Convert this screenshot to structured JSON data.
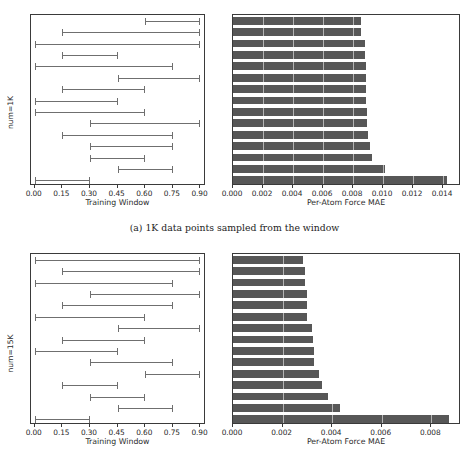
{
  "figure": {
    "captions": [
      {
        "text": "(a) 1K data points sampled from the window"
      },
      {
        "text": "(b) 15K data points sampled from the window"
      }
    ]
  },
  "chart_data": [
    {
      "type": "bar",
      "subplot": "a-left",
      "orientation": "horizontal-interval",
      "title": "",
      "xlabel": "Training Window",
      "ylabel": "num=1K",
      "xlim": [
        -0.02,
        0.93
      ],
      "xticks": [
        0.0,
        0.15,
        0.3,
        0.45,
        0.6,
        0.75,
        0.9
      ],
      "xticklabels": [
        "0.00",
        "0.15",
        "0.30",
        "0.45",
        "0.60",
        "0.75",
        "0.90"
      ],
      "grid": false,
      "n_items": 15,
      "intervals": [
        {
          "start": 0.6,
          "end": 0.9
        },
        {
          "start": 0.15,
          "end": 0.9
        },
        {
          "start": 0.0,
          "end": 0.9
        },
        {
          "start": 0.15,
          "end": 0.45
        },
        {
          "start": 0.0,
          "end": 0.75
        },
        {
          "start": 0.45,
          "end": 0.9
        },
        {
          "start": 0.15,
          "end": 0.6
        },
        {
          "start": 0.0,
          "end": 0.45
        },
        {
          "start": 0.0,
          "end": 0.6
        },
        {
          "start": 0.3,
          "end": 0.9
        },
        {
          "start": 0.15,
          "end": 0.75
        },
        {
          "start": 0.3,
          "end": 0.75
        },
        {
          "start": 0.3,
          "end": 0.6
        },
        {
          "start": 0.45,
          "end": 0.75
        },
        {
          "start": 0.0,
          "end": 0.3
        }
      ]
    },
    {
      "type": "bar",
      "subplot": "a-right",
      "orientation": "horizontal",
      "title": "",
      "xlabel": "Per-Atom Force MAE",
      "ylabel": "",
      "xlim": [
        0.0,
        0.0152
      ],
      "xticks": [
        0.0,
        0.002,
        0.004,
        0.006,
        0.008,
        0.01,
        0.012,
        0.014
      ],
      "xticklabels": [
        "0.000",
        "0.002",
        "0.004",
        "0.006",
        "0.008",
        "0.010",
        "0.012",
        "0.014"
      ],
      "grid": false,
      "values": [
        0.0085,
        0.00856,
        0.0088,
        0.00878,
        0.00886,
        0.00888,
        0.00888,
        0.00888,
        0.0089,
        0.00894,
        0.00896,
        0.009,
        0.0091,
        0.00925,
        0.01015,
        0.01425
      ],
      "values_used": [
        0.0085,
        0.00856,
        0.0088,
        0.00878,
        0.00886,
        0.00888,
        0.00888,
        0.00888,
        0.0089,
        0.00894,
        0.009,
        0.0091,
        0.00925,
        0.01015,
        0.01425
      ]
    },
    {
      "type": "bar",
      "subplot": "b-left",
      "orientation": "horizontal-interval",
      "title": "",
      "xlabel": "Training Window",
      "ylabel": "num=15K",
      "xlim": [
        -0.02,
        0.93
      ],
      "xticks": [
        0.0,
        0.15,
        0.3,
        0.45,
        0.6,
        0.75,
        0.9
      ],
      "xticklabels": [
        "0.00",
        "0.15",
        "0.30",
        "0.45",
        "0.60",
        "0.75",
        "0.90"
      ],
      "grid": false,
      "n_items": 15,
      "intervals": [
        {
          "start": 0.0,
          "end": 0.9
        },
        {
          "start": 0.15,
          "end": 0.9
        },
        {
          "start": 0.0,
          "end": 0.75
        },
        {
          "start": 0.3,
          "end": 0.9
        },
        {
          "start": 0.15,
          "end": 0.75
        },
        {
          "start": 0.0,
          "end": 0.6
        },
        {
          "start": 0.45,
          "end": 0.9
        },
        {
          "start": 0.15,
          "end": 0.6
        },
        {
          "start": 0.0,
          "end": 0.45
        },
        {
          "start": 0.3,
          "end": 0.75
        },
        {
          "start": 0.6,
          "end": 0.9
        },
        {
          "start": 0.15,
          "end": 0.45
        },
        {
          "start": 0.3,
          "end": 0.6
        },
        {
          "start": 0.45,
          "end": 0.75
        },
        {
          "start": 0.0,
          "end": 0.3
        }
      ]
    },
    {
      "type": "bar",
      "subplot": "b-right",
      "orientation": "horizontal",
      "title": "",
      "xlabel": "Per-Atom Force MAE",
      "ylabel": "",
      "xlim": [
        0.0,
        0.0092
      ],
      "xticks": [
        0.0,
        0.002,
        0.004,
        0.006,
        0.008
      ],
      "xticklabels": [
        "0.000",
        "0.002",
        "0.004",
        "0.006",
        "0.008"
      ],
      "grid": false,
      "values_used": [
        0.00283,
        0.00289,
        0.0029,
        0.003,
        0.003,
        0.003,
        0.0032,
        0.00322,
        0.00326,
        0.00328,
        0.00345,
        0.0036,
        0.00382,
        0.00432,
        0.0087
      ]
    }
  ]
}
